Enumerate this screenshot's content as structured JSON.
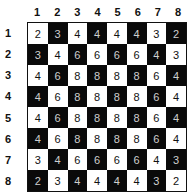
{
  "columns": [
    "1",
    "2",
    "3",
    "4",
    "5",
    "6",
    "7",
    "8"
  ],
  "rows": [
    "1",
    "2",
    "3",
    "4",
    "5",
    "6",
    "7",
    "8"
  ],
  "grid": [
    [
      2,
      3,
      4,
      4,
      4,
      4,
      3,
      2
    ],
    [
      3,
      4,
      6,
      6,
      6,
      6,
      4,
      3
    ],
    [
      4,
      6,
      8,
      8,
      8,
      8,
      6,
      4
    ],
    [
      4,
      6,
      8,
      8,
      8,
      8,
      6,
      4
    ],
    [
      4,
      6,
      8,
      8,
      8,
      8,
      6,
      4
    ],
    [
      4,
      6,
      8,
      8,
      8,
      8,
      6,
      4
    ],
    [
      3,
      4,
      6,
      6,
      6,
      6,
      4,
      3
    ],
    [
      2,
      3,
      4,
      4,
      4,
      4,
      3,
      2
    ]
  ],
  "colors": {
    "light": "#ffffff",
    "dark": "#0a0a0a"
  }
}
